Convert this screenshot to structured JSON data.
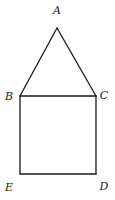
{
  "diagram": {
    "title": "",
    "stroke_color": "#1a1a1a",
    "background": "#ffffff",
    "vertices": {
      "A": {
        "label": "A",
        "x": 57,
        "y": 28,
        "label_x": 57,
        "label_y": 14
      },
      "B": {
        "label": "B",
        "x": 20,
        "y": 96,
        "label_x": 9,
        "label_y": 100
      },
      "C": {
        "label": "C",
        "x": 96,
        "y": 96,
        "label_x": 104,
        "label_y": 99
      },
      "D": {
        "label": "D",
        "x": 96,
        "y": 174,
        "label_x": 104,
        "label_y": 190
      },
      "E": {
        "label": "E",
        "x": 20,
        "y": 174,
        "label_x": 9,
        "label_y": 191
      }
    },
    "edges": [
      [
        "A",
        "B"
      ],
      [
        "A",
        "C"
      ],
      [
        "B",
        "C"
      ],
      [
        "C",
        "D"
      ],
      [
        "D",
        "E"
      ],
      [
        "E",
        "B"
      ]
    ],
    "shapes": [
      {
        "name": "triangle",
        "vertices": [
          "A",
          "B",
          "C"
        ]
      },
      {
        "name": "square",
        "vertices": [
          "B",
          "C",
          "D",
          "E"
        ]
      }
    ]
  }
}
